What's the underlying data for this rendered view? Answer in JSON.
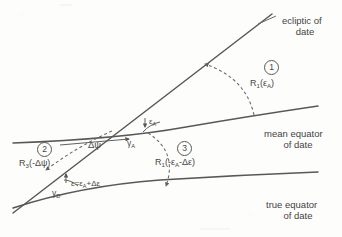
{
  "figure": {
    "background_color": "#fdfdfc",
    "line_color": "#5a5a5a",
    "text_color": "#474747"
  },
  "curves": [
    {
      "name": "ecliptic-of-date",
      "label_line1": "ecliptic of",
      "label_line2": "date",
      "style": "solid-straight"
    },
    {
      "name": "mean-equator-of-date",
      "label_line1": "mean equator",
      "label_line2": "of date",
      "style": "solid-curved"
    },
    {
      "name": "true-equator-of-date",
      "label_line1": "true equator",
      "label_line2": "of date",
      "style": "solid-curved"
    }
  ],
  "operations": [
    {
      "number": "1",
      "expr_prefix": "R",
      "expr_sub": "1",
      "expr_suffix": "(ε",
      "expr_arg_sub": "A",
      "expr_tail": ")",
      "full_text": "R1(εA)",
      "arrow": "dashed-curved-up"
    },
    {
      "number": "2",
      "expr_prefix": "R",
      "expr_sub": "3",
      "expr_suffix": "(-Δψ",
      "expr_arg_sub": "",
      "expr_tail": ")",
      "full_text": "R3(-Δψ)",
      "arrow": "dashed-curved-down-left"
    },
    {
      "number": "3",
      "expr_prefix": "R",
      "expr_sub": "1",
      "expr_suffix": "(-ε",
      "expr_arg_sub": "A",
      "expr_tail": "-Δε)",
      "full_text": "R1(-εA-Δε)",
      "arrow": "dashed-curved-down"
    }
  ],
  "angles": [
    {
      "name": "epsilon-A",
      "text": "ε",
      "sub": "A"
    },
    {
      "name": "delta-psi",
      "text": "Δψ",
      "sub": ""
    },
    {
      "name": "epsilon-total",
      "prefix": "ε=ε",
      "sub": "A",
      "suffix": "+Δε"
    }
  ],
  "points": [
    {
      "name": "gamma-A",
      "text": "γ",
      "sub": "A"
    },
    {
      "name": "gamma-D",
      "text": "γ",
      "sub": "D"
    }
  ]
}
